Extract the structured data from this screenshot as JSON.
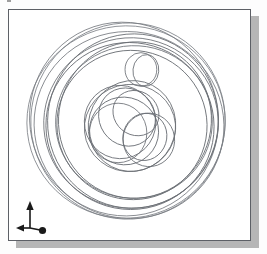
{
  "app": {
    "view_title": "",
    "background_color": "#ffffff",
    "frame_border_color": "#5d6066",
    "shadow_color": "#b6b6b6",
    "geometry_stroke_color": "#6b6f75"
  },
  "viewport": {
    "name": "isometric-wireframe-viewport",
    "frame": {
      "x": 8,
      "y": 9,
      "width": 243,
      "height": 232
    },
    "shadow_offset": {
      "x": 8,
      "y": 7
    }
  },
  "axis_triad": {
    "label": "3D axis orientation indicator",
    "origin_label": "",
    "axes": [
      {
        "name": "y-axis",
        "direction": "up",
        "glyph": "arrow-up",
        "label": ""
      },
      {
        "name": "x-axis",
        "direction": "left",
        "glyph": "arrow-left",
        "label": ""
      },
      {
        "name": "z-axis",
        "direction": "toward-viewer",
        "glyph": "dot",
        "label": ""
      }
    ],
    "color": "#1a1a1a"
  },
  "chart_data": {
    "type": "scatter",
    "title": "",
    "subtitle": "",
    "xlabel": "",
    "ylabel": "",
    "grid": false,
    "legend_position": "none",
    "xlim": [
      0,
      243
    ],
    "ylim": [
      0,
      232
    ],
    "groups": [
      {
        "name": "outer-rim-ellipses",
        "stroke": "#7a7e84",
        "stroke_width": 0.8,
        "ellipses": [
          {
            "cx": 118,
            "cy": 113,
            "rx": 100,
            "ry": 97,
            "rot": -6
          },
          {
            "cx": 120,
            "cy": 112,
            "rx": 98,
            "ry": 99,
            "rot": 8
          },
          {
            "cx": 121,
            "cy": 116,
            "rx": 96,
            "ry": 94,
            "rot": 22
          },
          {
            "cx": 116,
            "cy": 110,
            "rx": 95,
            "ry": 98,
            "rot": -18
          }
        ]
      },
      {
        "name": "mid-rim-ellipses",
        "stroke": "#6b6f75",
        "stroke_width": 0.85,
        "ellipses": [
          {
            "cx": 123,
            "cy": 114,
            "rx": 88,
            "ry": 86,
            "rot": -4
          },
          {
            "cx": 125,
            "cy": 112,
            "rx": 86,
            "ry": 88,
            "rot": 12
          },
          {
            "cx": 122,
            "cy": 117,
            "rx": 85,
            "ry": 84,
            "rot": 28
          }
        ]
      },
      {
        "name": "inner-rim-ellipses",
        "stroke": "#6b6f75",
        "stroke_width": 0.85,
        "ellipses": [
          {
            "cx": 126,
            "cy": 113,
            "rx": 79,
            "ry": 77,
            "rot": -2
          },
          {
            "cx": 127,
            "cy": 111,
            "rx": 77,
            "ry": 79,
            "rot": 14
          },
          {
            "cx": 124,
            "cy": 116,
            "rx": 76,
            "ry": 75,
            "rot": 33
          }
        ]
      },
      {
        "name": "bolt-hole-circles",
        "stroke": "#6b6f75",
        "stroke_width": 0.85,
        "ellipses": [
          {
            "cx": 133,
            "cy": 60,
            "rx": 16,
            "ry": 17,
            "rot": 0
          },
          {
            "cx": 138,
            "cy": 61,
            "rx": 13,
            "ry": 16,
            "rot": 6
          }
        ]
      },
      {
        "name": "hub-cluster-circles",
        "stroke": "#6b6f75",
        "stroke_width": 0.85,
        "ellipses": [
          {
            "cx": 122,
            "cy": 119,
            "rx": 46,
            "ry": 44,
            "rot": -5
          },
          {
            "cx": 124,
            "cy": 117,
            "rx": 44,
            "ry": 46,
            "rot": 16
          },
          {
            "cx": 112,
            "cy": 113,
            "rx": 36,
            "ry": 37,
            "rot": -10
          },
          {
            "cx": 116,
            "cy": 122,
            "rx": 35,
            "ry": 34,
            "rot": 24
          },
          {
            "cx": 110,
            "cy": 124,
            "rx": 29,
            "ry": 30,
            "rot": 0
          },
          {
            "cx": 141,
            "cy": 131,
            "rx": 26,
            "ry": 27,
            "rot": -8
          },
          {
            "cx": 137,
            "cy": 128,
            "rx": 22,
            "ry": 24,
            "rot": 18
          },
          {
            "cx": 128,
            "cy": 104,
            "rx": 24,
            "ry": 22,
            "rot": 40
          },
          {
            "cx": 119,
            "cy": 108,
            "rx": 30,
            "ry": 28,
            "rot": 55
          }
        ]
      }
    ]
  }
}
